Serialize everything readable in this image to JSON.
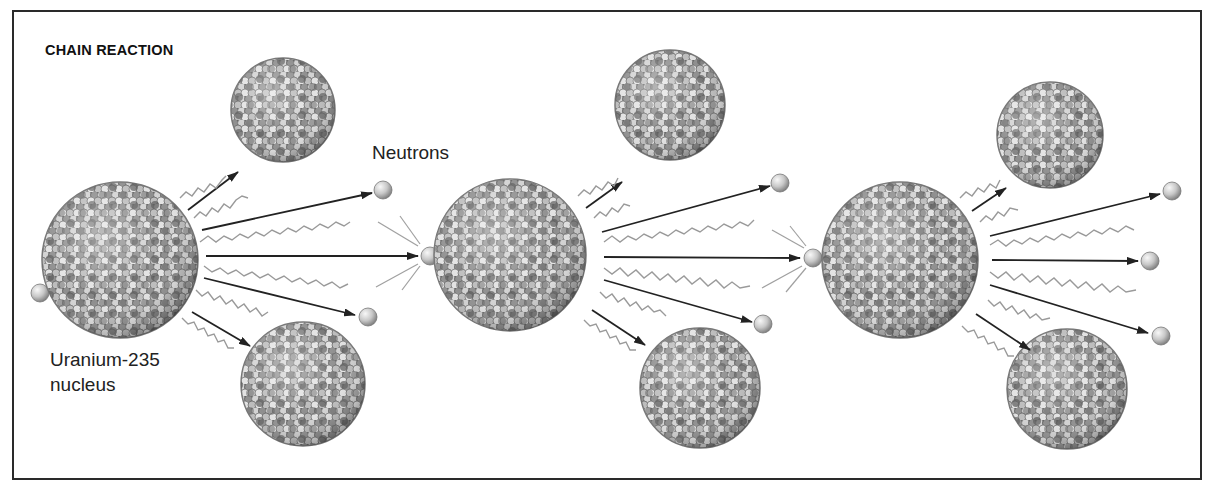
{
  "figure": {
    "title": "CHAIN REACTION",
    "labels": {
      "neutrons": "Neutrons",
      "uranium_line1": "Uranium-235",
      "uranium_line2": "nucleus"
    }
  },
  "colors": {
    "frame": "#2a2a2a",
    "arrow": "#222222",
    "wave": "#9a9a9a",
    "nucleon_light": "#e0e0e0",
    "nucleon_mid": "#9c9c9c",
    "nucleon_dark": "#5a5a5a"
  },
  "stages": [
    {
      "name": "stage-1",
      "nucleus": {
        "cx": 120,
        "cy": 260,
        "r": 78
      },
      "incoming_neutron": {
        "cx": 40,
        "cy": 293
      },
      "fragments": [
        {
          "cx": 283,
          "cy": 110,
          "r": 52
        },
        {
          "cx": 303,
          "cy": 384,
          "r": 62
        }
      ],
      "neutrons_out": [
        {
          "cx": 383,
          "cy": 190
        },
        {
          "cx": 430,
          "cy": 255
        },
        {
          "cx": 368,
          "cy": 317
        }
      ]
    },
    {
      "name": "stage-2",
      "nucleus": {
        "cx": 510,
        "cy": 255,
        "r": 76
      },
      "incoming_neutron": {
        "cx": 430,
        "cy": 255
      },
      "fragments": [
        {
          "cx": 670,
          "cy": 105,
          "r": 55
        },
        {
          "cx": 700,
          "cy": 388,
          "r": 60
        }
      ],
      "neutrons_out": [
        {
          "cx": 780,
          "cy": 183
        },
        {
          "cx": 813,
          "cy": 258
        },
        {
          "cx": 763,
          "cy": 324
        }
      ]
    },
    {
      "name": "stage-3",
      "nucleus": {
        "cx": 900,
        "cy": 260,
        "r": 78
      },
      "incoming_neutron": {
        "cx": 813,
        "cy": 258
      },
      "fragments": [
        {
          "cx": 1050,
          "cy": 135,
          "r": 53
        },
        {
          "cx": 1067,
          "cy": 389,
          "r": 60
        }
      ],
      "neutrons_out": [
        {
          "cx": 1172,
          "cy": 191
        },
        {
          "cx": 1150,
          "cy": 260
        },
        {
          "cx": 1161,
          "cy": 336
        }
      ]
    }
  ]
}
